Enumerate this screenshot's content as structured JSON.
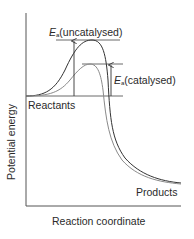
{
  "diagram": {
    "type": "energy-profile",
    "labels": {
      "uncatalysed_prefix": "E",
      "uncatalysed_sub": "a",
      "uncatalysed_suffix": "(uncatalysed)",
      "catalysed_prefix": "E",
      "catalysed_sub": "a",
      "catalysed_suffix": "(catalysed)",
      "reactants": "Reactants",
      "products": "Products",
      "y_axis": "Potential energy",
      "x_axis": "Reaction coordinate"
    },
    "colors": {
      "uncatalysed_curve": "#333333",
      "catalysed_curve": "#8a8a8a",
      "axes": "#555555",
      "text": "#2a2a2a"
    }
  }
}
